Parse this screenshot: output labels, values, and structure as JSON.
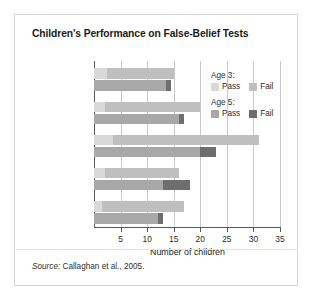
{
  "figure": {
    "title": "Children's Performance on False-Belief Tests",
    "source_prefix": "Source:",
    "source_text": " Callaghan et al., 2005."
  },
  "legend": {
    "groups": [
      {
        "head": "Age 3:",
        "pass_label": "Pass",
        "fail_label": "Fail",
        "pass_color": "#d9d9d9",
        "fail_color": "#bfbfbf"
      },
      {
        "head": "Age 5:",
        "pass_label": "Pass",
        "fail_label": "Fail",
        "pass_color": "#a8a8a8",
        "fail_color": "#6e6e6e"
      }
    ]
  },
  "chart_data": {
    "type": "bar",
    "orientation": "horizontal",
    "stacked": true,
    "title": "Children's Performance on False-Belief Tests",
    "xlabel": "Number of children",
    "ylabel": "",
    "xlim": [
      0,
      35
    ],
    "xticks": [
      5,
      10,
      15,
      20,
      25,
      30,
      35
    ],
    "grid": true,
    "legend_position": "inside-top-right",
    "categories": [
      "Canada",
      "India",
      "Peru",
      "Samoa",
      "Thailand"
    ],
    "series": [
      {
        "name": "Age 3: Pass",
        "color": "#d9d9d9",
        "values": [
          2.5,
          2.0,
          3.5,
          2.0,
          1.5
        ]
      },
      {
        "name": "Age 3: Fail",
        "color": "#bfbfbf",
        "values": [
          12.5,
          18.0,
          27.5,
          14.0,
          15.5
        ]
      },
      {
        "name": "Age 5: Pass",
        "color": "#a8a8a8",
        "values": [
          13.5,
          16.0,
          20.0,
          13.0,
          12.0
        ]
      },
      {
        "name": "Age 5: Fail",
        "color": "#6e6e6e",
        "values": [
          1.0,
          1.0,
          3.0,
          5.0,
          1.0
        ]
      }
    ],
    "totals": {
      "age3": [
        15,
        20,
        31,
        16,
        17
      ],
      "age5": [
        14.5,
        17,
        23,
        18,
        13
      ]
    }
  }
}
